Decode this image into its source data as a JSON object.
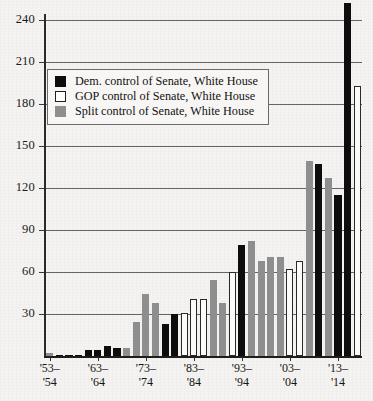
{
  "chart_data": {
    "type": "bar",
    "title": "",
    "xlabel": "",
    "ylabel": "",
    "ylim": [
      0,
      255
    ],
    "grid": true,
    "legend_position": "upper-left-inside",
    "y_ticks": [
      30,
      60,
      90,
      120,
      150,
      180,
      210,
      240
    ],
    "x_tick_labels": [
      {
        "top": "'53–",
        "bottom": "'54"
      },
      {
        "top": "'63–",
        "bottom": "'64"
      },
      {
        "top": "'73–",
        "bottom": "'74"
      },
      {
        "top": "'83–",
        "bottom": "'84"
      },
      {
        "top": "'93–",
        "bottom": "'94"
      },
      {
        "top": "'03–",
        "bottom": "'04"
      },
      {
        "top": "'13–",
        "bottom": "'14"
      }
    ],
    "series_legend": [
      {
        "key": "dem",
        "label": "Dem. control of Senate, White House",
        "color": "#0d0d0d"
      },
      {
        "key": "gop",
        "label": "GOP control of Senate, White House",
        "color": "#ffffff"
      },
      {
        "key": "split",
        "label": "Split control of Senate, White House",
        "color": "#8e8e8e"
      }
    ],
    "categories": [
      "'53-'54",
      "'55-'56",
      "'57-'58",
      "'59-'60",
      "'61-'62",
      "'63-'64",
      "'65-'66",
      "'67-'68",
      "'69-'70",
      "'71-'72",
      "'73-'74",
      "'75-'76",
      "'77-'78",
      "'79-'80",
      "'81-'82",
      "'83-'84",
      "'85-'86",
      "'87-'88",
      "'89-'90",
      "'91-'92",
      "'93-'94",
      "'95-'96",
      "'97-'98",
      "'99-'00",
      "'01-'02",
      "'03-'04",
      "'05-'06",
      "'07-'08",
      "'09-'10",
      "'11-'12",
      "'13-'14"
    ],
    "values": [
      2,
      0,
      0,
      0,
      4,
      4,
      7,
      6,
      6,
      24,
      44,
      38,
      23,
      30,
      31,
      41,
      41,
      54,
      38,
      60,
      79,
      82,
      68,
      71,
      71,
      62,
      68,
      139,
      137,
      115,
      252
    ],
    "groups": [
      "split",
      "dem",
      "dem",
      "dem",
      "dem",
      "dem",
      "dem",
      "dem",
      "split",
      "split",
      "split",
      "split",
      "dem",
      "dem",
      "gop",
      "gop",
      "gop",
      "split",
      "split",
      "gop",
      "dem",
      "split",
      "split",
      "split",
      "split",
      "gop",
      "gop",
      "split",
      "dem",
      "dem",
      "dem"
    ],
    "extra_bars": [
      {
        "value": 127,
        "group": "split"
      },
      {
        "value": 193,
        "group": "gop"
      }
    ],
    "max_value": 252,
    "note": "Bar heights read from the 30-unit gridlines; tallest black bar exceeds the 240 gridline."
  },
  "axis": {
    "y_tick_texts": [
      "240",
      "210",
      "180",
      "150",
      "120",
      "90",
      "60",
      "30"
    ]
  }
}
